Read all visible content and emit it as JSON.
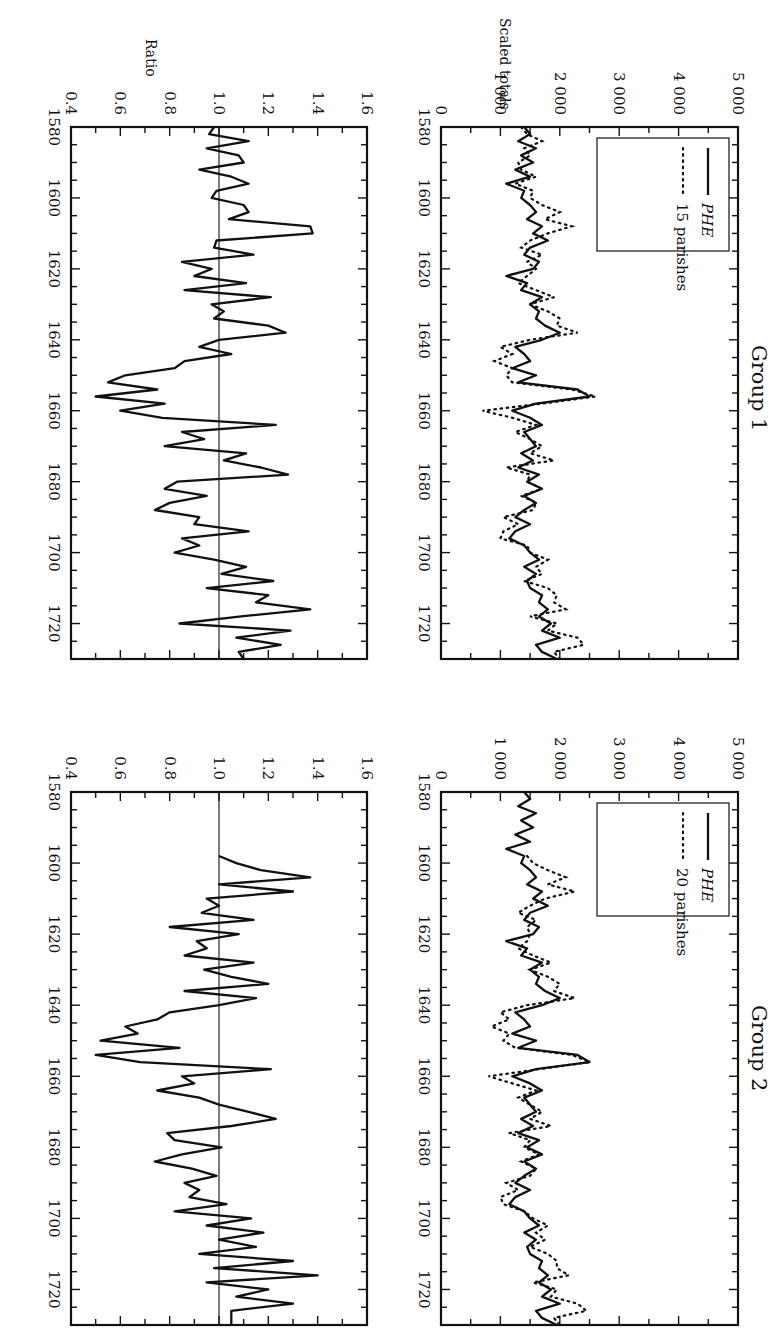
{
  "figure": {
    "orientation": "rotated 90 degrees clockwise (landscape figure on portrait page)"
  },
  "chart_data": [
    {
      "type": "line",
      "panel": "group-1-scaled-totals",
      "title": "Group 1",
      "xlabel": "",
      "ylabel": "Scaled totals",
      "xlim": [
        1580,
        1730
      ],
      "ylim": [
        0,
        5000
      ],
      "x_ticks": [
        "1580",
        "1600",
        "1620",
        "1640",
        "1660",
        "1680",
        "1700",
        "1720"
      ],
      "y_ticks": [
        "0",
        "1 000",
        "2 000",
        "3 000",
        "4 000",
        "5 000"
      ],
      "legend": [
        "PHE",
        "15 parishes"
      ],
      "legend_position": "top-left",
      "x": [
        1580,
        1582,
        1584,
        1586,
        1588,
        1590,
        1592,
        1594,
        1596,
        1598,
        1600,
        1602,
        1604,
        1606,
        1608,
        1610,
        1612,
        1614,
        1616,
        1618,
        1620,
        1622,
        1624,
        1626,
        1628,
        1630,
        1632,
        1634,
        1636,
        1638,
        1640,
        1642,
        1644,
        1646,
        1648,
        1650,
        1652,
        1654,
        1656,
        1658,
        1660,
        1662,
        1664,
        1666,
        1668,
        1670,
        1672,
        1674,
        1676,
        1678,
        1680,
        1682,
        1684,
        1686,
        1688,
        1690,
        1692,
        1694,
        1696,
        1698,
        1700,
        1702,
        1704,
        1706,
        1708,
        1710,
        1712,
        1714,
        1716,
        1718,
        1720,
        1722,
        1724,
        1726,
        1728,
        1730
      ],
      "series": [
        {
          "name": "PHE",
          "style": "solid",
          "values": [
            1400,
            1500,
            1300,
            1600,
            1350,
            1550,
            1250,
            1500,
            1100,
            1400,
            1350,
            1500,
            1600,
            1450,
            1700,
            1550,
            1800,
            1500,
            1400,
            1650,
            1550,
            1100,
            1450,
            1350,
            1700,
            1500,
            1650,
            1600,
            1750,
            2000,
            1700,
            1250,
            1400,
            1500,
            1200,
            1600,
            1300,
            2300,
            2500,
            1600,
            1200,
            1500,
            1700,
            1400,
            1500,
            1600,
            1350,
            1550,
            1300,
            1650,
            1450,
            1700,
            1400,
            1600,
            1400,
            1250,
            1500,
            1250,
            1150,
            1400,
            1500,
            1650,
            1400,
            1600,
            1450,
            1500,
            1700,
            1650,
            1800,
            1650,
            1850,
            1700,
            2000,
            1600,
            1700,
            1950
          ]
        },
        {
          "name": "15 parishes",
          "style": "dotted",
          "values": [
            1350,
            1450,
            1700,
            1400,
            1500,
            1300,
            1350,
            1600,
            1250,
            1550,
            1500,
            1700,
            2000,
            1750,
            2200,
            1800,
            1500,
            1350,
            1700,
            1450,
            1600,
            1450,
            1300,
            1600,
            1900,
            1500,
            1800,
            2000,
            1950,
            2300,
            1500,
            1000,
            1200,
            900,
            1200,
            1100,
            1200,
            2200,
            2600,
            1700,
            700,
            1200,
            1600,
            1250,
            1500,
            1700,
            1500,
            1900,
            1100,
            1500,
            1450,
            1700,
            1350,
            1600,
            1550,
            1050,
            1300,
            1050,
            1000,
            1450,
            1500,
            1800,
            1600,
            1700,
            1400,
            1800,
            1950,
            1900,
            2100,
            1500,
            1950,
            1800,
            2300,
            2400,
            1900,
            2000
          ]
        }
      ]
    },
    {
      "type": "line",
      "panel": "group-1-ratio",
      "title": "",
      "xlabel": "",
      "ylabel": "Ratio",
      "xlim": [
        1580,
        1730
      ],
      "ylim": [
        0.4,
        1.6
      ],
      "x_ticks": [
        "1580",
        "1600",
        "1620",
        "1640",
        "1660",
        "1680",
        "1700",
        "1720"
      ],
      "y_ticks": [
        "0.4",
        "0.6",
        "0.8",
        "1.0",
        "1.2",
        "1.4",
        "1.6"
      ],
      "reference_line": 1.0,
      "x": [
        1580,
        1582,
        1584,
        1586,
        1588,
        1590,
        1592,
        1594,
        1596,
        1598,
        1600,
        1602,
        1604,
        1606,
        1608,
        1610,
        1612,
        1614,
        1616,
        1618,
        1620,
        1622,
        1624,
        1626,
        1628,
        1630,
        1632,
        1634,
        1636,
        1638,
        1640,
        1642,
        1644,
        1646,
        1648,
        1650,
        1652,
        1654,
        1656,
        1658,
        1660,
        1662,
        1664,
        1666,
        1668,
        1670,
        1672,
        1674,
        1676,
        1678,
        1680,
        1682,
        1684,
        1686,
        1688,
        1690,
        1692,
        1694,
        1696,
        1698,
        1700,
        1702,
        1704,
        1706,
        1708,
        1710,
        1712,
        1714,
        1716,
        1718,
        1720,
        1722,
        1724,
        1726,
        1728,
        1730
      ],
      "series": [
        {
          "name": "Ratio",
          "style": "solid",
          "values": [
            0.98,
            0.96,
            1.12,
            0.95,
            1.08,
            1.1,
            0.92,
            1.05,
            1.12,
            0.99,
            0.97,
            1.1,
            1.12,
            1.04,
            1.37,
            1.38,
            0.99,
            0.98,
            1.14,
            0.85,
            0.97,
            0.9,
            1.11,
            0.86,
            1.21,
            0.97,
            1.02,
            0.98,
            1.2,
            1.27,
            1.0,
            0.92,
            1.05,
            0.86,
            0.82,
            0.62,
            0.55,
            0.75,
            0.5,
            0.78,
            0.6,
            0.77,
            1.23,
            0.85,
            0.94,
            0.78,
            1.11,
            1.02,
            1.17,
            1.28,
            0.83,
            0.78,
            0.95,
            0.8,
            0.74,
            0.92,
            0.9,
            1.12,
            0.85,
            0.92,
            0.82,
            0.98,
            1.11,
            1.01,
            1.22,
            0.95,
            1.2,
            1.15,
            1.37,
            1.09,
            0.84,
            1.29,
            1.07,
            1.25,
            1.08,
            1.1
          ]
        }
      ]
    },
    {
      "type": "line",
      "panel": "group-2-scaled-totals",
      "title": "Group 2",
      "xlabel": "",
      "ylabel": "",
      "xlim": [
        1580,
        1730
      ],
      "ylim": [
        0,
        5000
      ],
      "x_ticks": [
        "1580",
        "1600",
        "1620",
        "1640",
        "1660",
        "1680",
        "1700",
        "1720"
      ],
      "y_ticks": [
        "0",
        "1 000",
        "2 000",
        "3 000",
        "4 000",
        "5 000"
      ],
      "legend": [
        "PHE",
        "20 parishes"
      ],
      "legend_position": "top-left",
      "x": [
        1580,
        1582,
        1584,
        1586,
        1588,
        1590,
        1592,
        1594,
        1596,
        1598,
        1600,
        1602,
        1604,
        1606,
        1608,
        1610,
        1612,
        1614,
        1616,
        1618,
        1620,
        1622,
        1624,
        1626,
        1628,
        1630,
        1632,
        1634,
        1636,
        1638,
        1640,
        1642,
        1644,
        1646,
        1648,
        1650,
        1652,
        1654,
        1656,
        1658,
        1660,
        1662,
        1664,
        1666,
        1668,
        1670,
        1672,
        1674,
        1676,
        1678,
        1680,
        1682,
        1684,
        1686,
        1688,
        1690,
        1692,
        1694,
        1696,
        1698,
        1700,
        1702,
        1704,
        1706,
        1708,
        1710,
        1712,
        1714,
        1716,
        1718,
        1720,
        1722,
        1724,
        1726,
        1728,
        1730
      ],
      "series": [
        {
          "name": "PHE",
          "style": "solid",
          "values": [
            1400,
            1500,
            1300,
            1600,
            1350,
            1550,
            1250,
            1500,
            1100,
            1400,
            1350,
            1500,
            1600,
            1450,
            1700,
            1550,
            1800,
            1500,
            1400,
            1650,
            1550,
            1100,
            1450,
            1350,
            1700,
            1500,
            1650,
            1600,
            1750,
            2000,
            1700,
            1250,
            1400,
            1500,
            1200,
            1600,
            1300,
            2300,
            2500,
            1600,
            1200,
            1500,
            1700,
            1400,
            1500,
            1600,
            1350,
            1550,
            1300,
            1650,
            1450,
            1700,
            1400,
            1600,
            1400,
            1250,
            1500,
            1250,
            1150,
            1400,
            1500,
            1650,
            1400,
            1600,
            1450,
            1500,
            1700,
            1650,
            1800,
            1650,
            1850,
            1700,
            2000,
            1600,
            1700,
            1950
          ]
        },
        {
          "name": "20 parishes",
          "style": "dotted",
          "values": [
            null,
            null,
            null,
            null,
            null,
            null,
            null,
            null,
            null,
            1450,
            1550,
            1800,
            2100,
            1800,
            2250,
            1750,
            1500,
            1300,
            1600,
            1450,
            1500,
            1450,
            1300,
            1550,
            1850,
            1500,
            1800,
            2000,
            1900,
            2250,
            1450,
            1000,
            1150,
            850,
            1150,
            1050,
            1250,
            2200,
            2500,
            1650,
            800,
            1200,
            1600,
            1300,
            1500,
            1700,
            1500,
            1850,
            1150,
            1500,
            1400,
            1650,
            1350,
            1600,
            1500,
            1100,
            1300,
            1000,
            1050,
            1400,
            1550,
            1800,
            1600,
            1750,
            1500,
            1800,
            1950,
            1950,
            2150,
            1550,
            1950,
            1850,
            2300,
            2450,
            1900,
            2000
          ]
        }
      ]
    },
    {
      "type": "line",
      "panel": "group-2-ratio",
      "title": "",
      "xlabel": "",
      "ylabel": "",
      "xlim": [
        1580,
        1730
      ],
      "ylim": [
        0.4,
        1.6
      ],
      "x_ticks": [
        "1580",
        "1600",
        "1620",
        "1640",
        "1660",
        "1680",
        "1700",
        "1720"
      ],
      "y_ticks": [
        "0.4",
        "0.6",
        "0.8",
        "1.0",
        "1.2",
        "1.4",
        "1.6"
      ],
      "reference_line": 1.0,
      "x": [
        1598,
        1600,
        1602,
        1604,
        1606,
        1608,
        1610,
        1612,
        1614,
        1616,
        1618,
        1620,
        1622,
        1624,
        1626,
        1628,
        1630,
        1632,
        1634,
        1636,
        1638,
        1640,
        1642,
        1644,
        1646,
        1648,
        1650,
        1652,
        1654,
        1656,
        1658,
        1660,
        1662,
        1664,
        1666,
        1668,
        1670,
        1672,
        1674,
        1676,
        1678,
        1680,
        1682,
        1684,
        1686,
        1688,
        1690,
        1692,
        1694,
        1696,
        1698,
        1700,
        1702,
        1704,
        1706,
        1708,
        1710,
        1712,
        1714,
        1716,
        1718,
        1720,
        1722,
        1724,
        1726,
        1728,
        1730
      ],
      "series": [
        {
          "name": "Ratio",
          "style": "solid",
          "values": [
            1.0,
            1.07,
            1.17,
            1.37,
            1.0,
            1.3,
            0.95,
            1.0,
            0.93,
            1.14,
            0.8,
            1.08,
            0.91,
            0.95,
            0.86,
            1.14,
            0.94,
            1.05,
            1.2,
            0.86,
            1.15,
            1.0,
            0.8,
            0.75,
            0.62,
            0.67,
            0.52,
            0.84,
            0.5,
            0.68,
            1.21,
            0.85,
            0.9,
            0.75,
            0.92,
            1.0,
            1.12,
            1.23,
            1.05,
            0.79,
            0.82,
            1.01,
            0.85,
            0.74,
            0.89,
            0.99,
            0.86,
            0.92,
            0.88,
            1.03,
            0.82,
            1.13,
            0.95,
            1.18,
            1.0,
            1.15,
            0.92,
            1.3,
            0.98,
            1.4,
            0.95,
            1.2,
            1.07,
            1.3,
            1.05,
            1.05,
            1.05
          ]
        }
      ]
    }
  ]
}
